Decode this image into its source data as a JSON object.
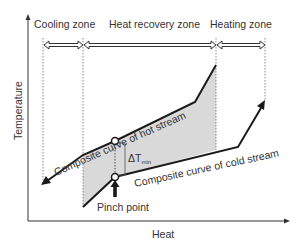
{
  "diagram": {
    "type": "pinch-analysis-composite-curves",
    "zones": [
      {
        "label": "Cooling zone"
      },
      {
        "label": "Heat recovery zone"
      },
      {
        "label": "Heating zone"
      }
    ],
    "axes": {
      "x_label": "Heat",
      "y_label": "Temperature"
    },
    "curves": {
      "hot": {
        "label": "Composite curve of hot stream"
      },
      "cold": {
        "label": "Composite curve of cold stream"
      }
    },
    "annotations": {
      "delta_t_symbol": "ΔT",
      "delta_t_subscript": "min",
      "pinch_label": "Pinch point"
    },
    "colors": {
      "line": "#1a1a1a",
      "shade": "#d9d9d9",
      "dotted": "#888888",
      "text": "#333333"
    }
  }
}
